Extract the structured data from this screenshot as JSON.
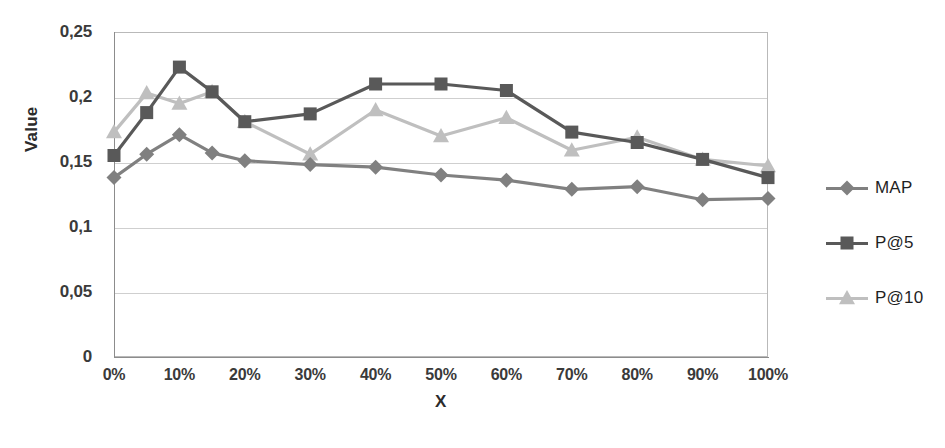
{
  "chart_data": {
    "type": "line",
    "title": "",
    "xlabel": "X",
    "ylabel": "Value",
    "ylim": [
      0,
      0.25
    ],
    "grid": true,
    "legend_position": "right",
    "decimal_separator": ",",
    "y_ticks": [
      "0,25",
      "0,2",
      "0,15",
      "0,1",
      "0,05",
      "0"
    ],
    "y_tick_values": [
      0.25,
      0.2,
      0.15,
      0.1,
      0.05,
      0
    ],
    "x_ticks": [
      "0%",
      "10%",
      "20%",
      "30%",
      "40%",
      "50%",
      "60%",
      "70%",
      "80%",
      "90%",
      "100%"
    ],
    "x_tick_values": [
      0,
      10,
      20,
      30,
      40,
      50,
      60,
      70,
      80,
      90,
      100
    ],
    "x": [
      0,
      5,
      10,
      15,
      20,
      30,
      40,
      50,
      60,
      70,
      80,
      90,
      100
    ],
    "series": [
      {
        "name": "MAP",
        "marker": "diamond",
        "color": "#808080",
        "values": [
          0.138,
          0.156,
          0.171,
          0.157,
          0.151,
          0.148,
          0.146,
          0.14,
          0.136,
          0.129,
          0.131,
          0.121,
          0.122
        ]
      },
      {
        "name": "P@5",
        "marker": "square",
        "color": "#595959",
        "values": [
          0.155,
          0.188,
          0.223,
          0.204,
          0.181,
          0.187,
          0.21,
          0.21,
          0.205,
          0.173,
          0.165,
          0.152,
          0.138
        ]
      },
      {
        "name": "P@10",
        "marker": "triangle",
        "color": "#bfbfbf",
        "values": [
          0.173,
          0.203,
          0.195,
          0.204,
          0.181,
          0.156,
          0.19,
          0.17,
          0.184,
          0.159,
          0.169,
          0.152,
          0.147
        ]
      }
    ]
  },
  "legend": {
    "items": [
      {
        "label": "MAP"
      },
      {
        "label": "P@5"
      },
      {
        "label": "P@10"
      }
    ]
  },
  "axes": {
    "y_title": "Value",
    "x_title": "X"
  }
}
